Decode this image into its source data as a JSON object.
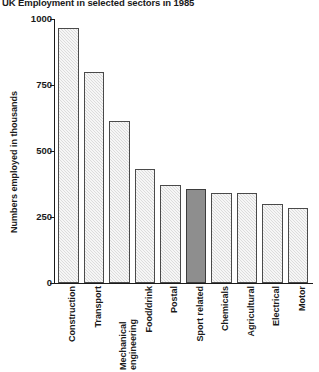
{
  "chart_data": {
    "type": "bar",
    "title": "UK Employment in selected sectors in 1985",
    "xlabel": "",
    "ylabel": "Numbers employed in thousands",
    "ylim": [
      0,
      1000
    ],
    "ytick_labels": [
      "1000",
      "750",
      "500",
      "250",
      "0"
    ],
    "yticks": [
      1000,
      750,
      500,
      250,
      0
    ],
    "grid": false,
    "legend": "none",
    "categories": [
      "Construction",
      "Transport",
      "Mechanical engineering",
      "Food/drink",
      "Postal",
      "Sport related",
      "Chemicals",
      "Agricultural",
      "Electrical",
      "Motor"
    ],
    "values": [
      965,
      800,
      615,
      430,
      370,
      355,
      340,
      340,
      300,
      285
    ],
    "highlight_index": 5,
    "highlight_label": "Sport related",
    "colors": {
      "bar_fill": "#dcdcdc",
      "bar_edge": "#4a4a4a",
      "highlight_fill": "#8e8e8e",
      "axis": "#1a1a1a",
      "text": "#1a1a1a",
      "background": "#ffffff"
    }
  }
}
